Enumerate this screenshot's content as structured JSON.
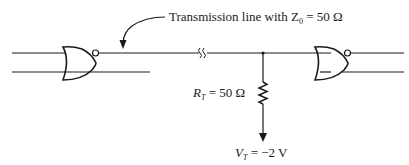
{
  "annotation": {
    "prefix": "Transmission line with Z",
    "subscript": "0",
    "suffix": " = 50 Ω"
  },
  "resistor": {
    "symbol": "R",
    "subscript": "T",
    "value": " = 50 Ω"
  },
  "voltage": {
    "symbol": "V",
    "subscript": "T",
    "value": " = −2 V"
  },
  "components": {
    "driver_gate": "NOR gate (driver)",
    "receiver_gate": "NOR gate (receiver)",
    "line_break": "transmission line break symbol",
    "termination_resistor": "termination resistor",
    "termination_supply": "termination voltage supply"
  },
  "colors": {
    "stroke": "#1a1a1a",
    "background": "#ffffff"
  }
}
